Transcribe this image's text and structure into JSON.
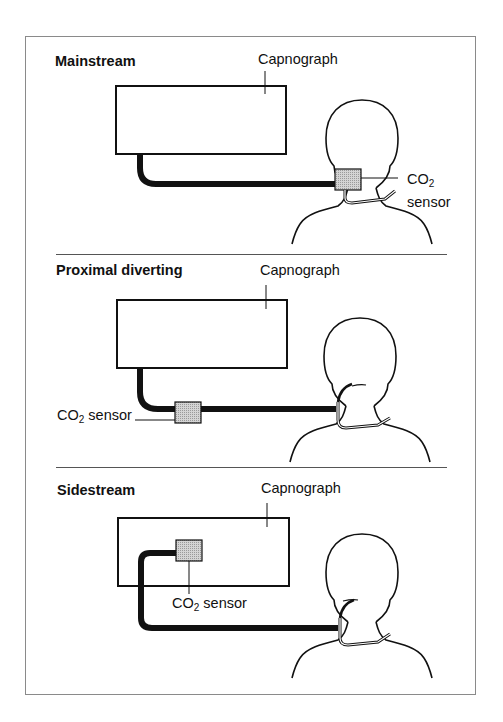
{
  "panels": [
    {
      "title": "Mainstream",
      "device_label": "Capnograph",
      "sensor_label_main": "CO",
      "sensor_label_sub": "2",
      "sensor_label_line2": "sensor"
    },
    {
      "title": "Proximal diverting",
      "device_label": "Capnograph",
      "sensor_label_main": "CO",
      "sensor_label_sub": "2",
      "sensor_label_rest": " sensor"
    },
    {
      "title": "Sidestream",
      "device_label": "Capnograph",
      "sensor_label_main": "CO",
      "sensor_label_sub": "2",
      "sensor_label_rest": " sensor"
    }
  ],
  "colors": {
    "line": "#111111",
    "sensor_fill": "#c8c8c8",
    "frame": "#8a8a8a"
  }
}
